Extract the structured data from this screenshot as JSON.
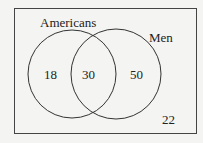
{
  "diagram": {
    "type": "venn",
    "sets": [
      {
        "name": "Americans",
        "only_value": "18"
      },
      {
        "name": "Men",
        "only_value": "50"
      }
    ],
    "intersection_value": "30",
    "outside_value": "22",
    "colors": {
      "stroke": "#333333",
      "background": "#f4f4f2"
    }
  }
}
